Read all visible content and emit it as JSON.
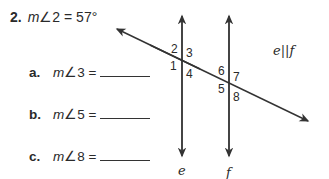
{
  "problem": {
    "number": "2.",
    "given_prefix": "m",
    "given_angle": "∠2",
    "given_eq": " = 57°"
  },
  "questions": [
    {
      "label": "a.",
      "m": "m",
      "angle": "∠3",
      "eq": " ="
    },
    {
      "label": "b.",
      "m": "m",
      "angle": "∠5",
      "eq": " ="
    },
    {
      "label": "c.",
      "m": "m",
      "angle": "∠8",
      "eq": " ="
    }
  ],
  "diagram": {
    "angle_labels": [
      "1",
      "2",
      "3",
      "4",
      "5",
      "6",
      "7",
      "8"
    ],
    "line_e": "e",
    "line_f": "f",
    "parallel_note": "e||f"
  }
}
